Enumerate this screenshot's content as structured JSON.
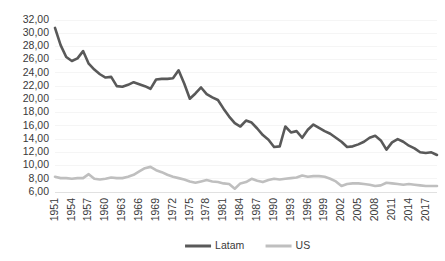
{
  "chart_data": {
    "type": "line",
    "title": "",
    "subtitle": "",
    "xlabel": "",
    "ylabel": "",
    "grid": true,
    "legend_position": "bottom",
    "ylim": [
      6,
      32
    ],
    "ytick_step": 2,
    "ytick_labels": [
      "32,00",
      "30,00",
      "28,00",
      "26,00",
      "24,00",
      "22,00",
      "20,00",
      "18,00",
      "16,00",
      "14,00",
      "12,00",
      "10,00",
      "8,00",
      "6,00"
    ],
    "ytick_values": [
      32,
      30,
      28,
      26,
      24,
      22,
      20,
      18,
      16,
      14,
      12,
      10,
      8,
      6
    ],
    "xlim": [
      1951,
      2019
    ],
    "xtick_labels": [
      "1951",
      "1954",
      "1957",
      "1960",
      "1963",
      "1966",
      "1969",
      "1972",
      "1975",
      "1978",
      "1981",
      "1984",
      "1987",
      "1990",
      "1993",
      "1996",
      "1999",
      "2002",
      "2005",
      "2008",
      "2011",
      "2014",
      "2017"
    ],
    "xtick_values": [
      1951,
      1954,
      1957,
      1960,
      1963,
      1966,
      1969,
      1972,
      1975,
      1978,
      1981,
      1984,
      1987,
      1990,
      1993,
      1996,
      1999,
      2002,
      2005,
      2008,
      2011,
      2014,
      2017
    ],
    "x": [
      1951,
      1952,
      1953,
      1954,
      1955,
      1956,
      1957,
      1958,
      1959,
      1960,
      1961,
      1962,
      1963,
      1964,
      1965,
      1966,
      1967,
      1968,
      1969,
      1970,
      1971,
      1972,
      1973,
      1974,
      1975,
      1976,
      1977,
      1978,
      1979,
      1980,
      1981,
      1982,
      1983,
      1984,
      1985,
      1986,
      1987,
      1988,
      1989,
      1990,
      1991,
      1992,
      1993,
      1994,
      1995,
      1996,
      1997,
      1998,
      1999,
      2000,
      2001,
      2002,
      2003,
      2004,
      2005,
      2006,
      2007,
      2008,
      2009,
      2010,
      2011,
      2012,
      2013,
      2014,
      2015,
      2016,
      2017,
      2018,
      2019
    ],
    "series": [
      {
        "name": "Latam",
        "color": "#595959",
        "width": 2.6,
        "values": [
          30.8,
          28.2,
          26.4,
          25.8,
          26.2,
          27.3,
          25.4,
          24.5,
          23.8,
          23.3,
          23.4,
          22.0,
          21.9,
          22.2,
          22.6,
          22.3,
          22.0,
          21.6,
          23.0,
          23.1,
          23.1,
          23.2,
          24.4,
          22.4,
          20.1,
          20.9,
          21.8,
          20.8,
          20.3,
          19.9,
          18.6,
          17.4,
          16.4,
          15.9,
          16.8,
          16.5,
          15.6,
          14.6,
          13.9,
          12.8,
          12.9,
          15.9,
          15.0,
          15.2,
          14.2,
          15.4,
          16.2,
          15.7,
          15.2,
          14.8,
          14.2,
          13.6,
          12.8,
          12.9,
          13.2,
          13.6,
          14.2,
          14.5,
          13.8,
          12.4,
          13.5,
          14.0,
          13.6,
          13.0,
          12.6,
          12.0,
          11.9,
          12.0,
          11.6
        ]
      },
      {
        "name": "US",
        "color": "#bfbfbf",
        "width": 2.6,
        "values": [
          8.3,
          8.1,
          8.1,
          8.0,
          8.1,
          8.1,
          8.7,
          8.0,
          7.9,
          8.0,
          8.2,
          8.1,
          8.1,
          8.3,
          8.6,
          9.1,
          9.6,
          9.8,
          9.3,
          9.0,
          8.6,
          8.3,
          8.1,
          7.9,
          7.6,
          7.4,
          7.6,
          7.8,
          7.6,
          7.5,
          7.3,
          7.2,
          6.5,
          7.3,
          7.5,
          8.0,
          7.7,
          7.5,
          7.8,
          8.0,
          7.9,
          8.0,
          8.1,
          8.2,
          8.5,
          8.3,
          8.4,
          8.4,
          8.3,
          8.0,
          7.6,
          6.9,
          7.2,
          7.3,
          7.3,
          7.2,
          7.1,
          6.9,
          7.0,
          7.4,
          7.3,
          7.2,
          7.1,
          7.2,
          7.1,
          7.0,
          6.9,
          6.9,
          6.9
        ]
      }
    ]
  },
  "legend": {
    "items": [
      {
        "label": "Latam",
        "color": "#595959"
      },
      {
        "label": "US",
        "color": "#bfbfbf"
      }
    ]
  }
}
